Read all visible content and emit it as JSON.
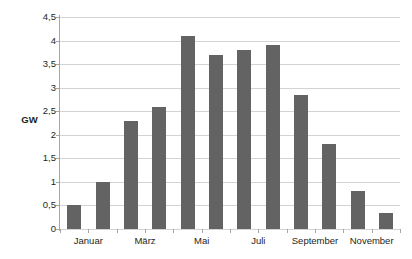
{
  "chart_data": {
    "type": "bar",
    "title": "",
    "subtitle": "",
    "xlabel": "",
    "ylabel": "GW",
    "ylim": [
      0,
      4.5
    ],
    "ytick_step": 0.5,
    "grid": true,
    "legend": false,
    "decimal_separator": ",",
    "bar_color": "#636363",
    "gridline_color": "#d3d3d3",
    "axis_color": "#a6a6a6",
    "categories": [
      "Januar",
      "Februar",
      "März",
      "April",
      "Mai",
      "Juni",
      "Juli",
      "August",
      "September",
      "Oktober",
      "November",
      "Dezember"
    ],
    "values": [
      0.5,
      1.0,
      2.3,
      2.6,
      4.1,
      3.7,
      3.8,
      3.9,
      2.85,
      1.8,
      0.8,
      0.35
    ],
    "ytick_labels": [
      "0",
      "0,5",
      "1",
      "1,5",
      "2",
      "2,5",
      "3",
      "3,5",
      "4",
      "4,5"
    ],
    "ytick_values": [
      0,
      0.5,
      1,
      1.5,
      2,
      2.5,
      3,
      3.5,
      4,
      4.5
    ],
    "xtick_labels_visible": [
      {
        "index": 0,
        "label": "Januar"
      },
      {
        "index": 2,
        "label": "März"
      },
      {
        "index": 4,
        "label": "Mai"
      },
      {
        "index": 6,
        "label": "Juli"
      },
      {
        "index": 8,
        "label": "September"
      },
      {
        "index": 10,
        "label": "November"
      }
    ]
  }
}
